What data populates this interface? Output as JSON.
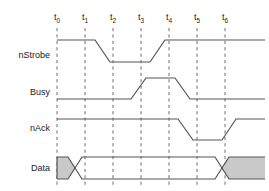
{
  "diagram": {
    "type": "timing-diagram",
    "background_color": "#ffffff",
    "line_color": "#555555",
    "gridline_color": "#6e6e6e",
    "shade_color": "#c9c9c9",
    "time_axis": {
      "label_y": 20,
      "ticks": [
        {
          "id": "t0",
          "base": "t",
          "sub": "0",
          "x": 57
        },
        {
          "id": "t1",
          "base": "t",
          "sub": "1",
          "x": 85
        },
        {
          "id": "t2",
          "base": "t",
          "sub": "2",
          "x": 113
        },
        {
          "id": "t3",
          "base": "t",
          "sub": "3",
          "x": 141
        },
        {
          "id": "t4",
          "base": "t",
          "sub": "4",
          "x": 169
        },
        {
          "id": "t5",
          "base": "t",
          "sub": "5",
          "x": 197
        },
        {
          "id": "t6",
          "base": "t",
          "sub": "6",
          "x": 225
        }
      ],
      "gridline_top": 28,
      "gridline_bottom": 187
    },
    "signals": [
      {
        "name": "nStrobe",
        "label": "nStrobe",
        "label_x": 50,
        "label_y": 58,
        "kind": "logic",
        "high_y": 40,
        "low_y": 62,
        "initial_level": "high",
        "path": "M 57 40 L 95 40 L 110 62 L 150 62 L 165 40 L 265 40",
        "transitions": [
          {
            "from": "high",
            "to": "low",
            "start_x": 95,
            "end_x": 110
          },
          {
            "from": "low",
            "to": "high",
            "start_x": 150,
            "end_x": 165
          }
        ]
      },
      {
        "name": "Busy",
        "label": "Busy",
        "label_x": 50,
        "label_y": 95,
        "kind": "logic",
        "high_y": 78,
        "low_y": 99,
        "initial_level": "low",
        "path": "M 57 99 L 131 99 L 146 78 L 175 78 L 190 99 L 265 99",
        "transitions": [
          {
            "from": "low",
            "to": "high",
            "start_x": 131,
            "end_x": 146
          },
          {
            "from": "high",
            "to": "low",
            "start_x": 175,
            "end_x": 190
          }
        ]
      },
      {
        "name": "nAck",
        "label": "nAck",
        "label_x": 50,
        "label_y": 131,
        "kind": "logic",
        "high_y": 119,
        "low_y": 140,
        "initial_level": "high",
        "path": "M 57 119 L 178 119 L 193 140 L 222 140 L 236 119 L 265 119",
        "transitions": [
          {
            "from": "high",
            "to": "low",
            "start_x": 178,
            "end_x": 193
          },
          {
            "from": "low",
            "to": "high",
            "start_x": 222,
            "end_x": 236
          }
        ]
      },
      {
        "name": "Data",
        "label": "Data",
        "label_x": 50,
        "label_y": 171,
        "kind": "bus",
        "top_y": 157,
        "bottom_y": 179,
        "start_x": 57,
        "end_x": 265,
        "shaded_regions": [
          {
            "from_x": 57,
            "to_x": 68
          },
          {
            "from_x": 229,
            "to_x": 265
          }
        ],
        "crossings": [
          {
            "start_x": 68,
            "end_x": 82
          },
          {
            "start_x": 215,
            "end_x": 229
          }
        ],
        "valid_region": {
          "from_x": 82,
          "to_x": 215
        },
        "bus_top_path": "M 57 157 L 68 157 L 82 179 L 215 179 L 229 157 L 265 157",
        "bus_bottom_path": "M 57 179 L 68 179 L 82 157 L 215 157 L 229 179 L 265 179",
        "shade_path_left": "M 57 157 L 68 157 L 76 168 L 68 179 L 57 179 Z",
        "shade_path_right": "M 229 157 L 265 157 L 265 179 L 229 179 L 221 168 Z"
      }
    ]
  }
}
